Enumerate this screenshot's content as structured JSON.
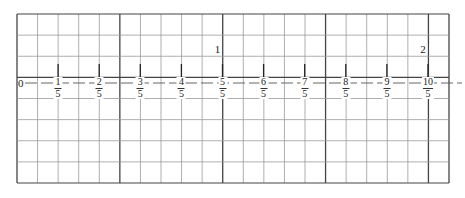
{
  "worksheet": {
    "title": "",
    "grid": {
      "columns": 21,
      "rows": 8,
      "left": 17,
      "top": 14,
      "right": 449,
      "bottom": 183,
      "major_every": 5,
      "minor_color": "#9a9a9a",
      "major_color": "#444444"
    },
    "number_line": {
      "axis_row_y": 77,
      "dash_y": 83,
      "start_label": "0",
      "step_px": 41.1,
      "origin_x": 17,
      "ticks": [
        {
          "num": "1",
          "den": "5"
        },
        {
          "num": "2",
          "den": "5"
        },
        {
          "num": "3",
          "den": "5"
        },
        {
          "num": "4",
          "den": "5"
        },
        {
          "num": "5",
          "den": "5"
        },
        {
          "num": "6",
          "den": "5"
        },
        {
          "num": "7",
          "den": "5"
        },
        {
          "num": "8",
          "den": "5"
        },
        {
          "num": "9",
          "den": "5"
        },
        {
          "num": "10",
          "den": "5"
        }
      ],
      "whole_labels": [
        {
          "text": "1",
          "at_tick": 5
        },
        {
          "text": "2",
          "at_tick": 10
        }
      ]
    }
  }
}
